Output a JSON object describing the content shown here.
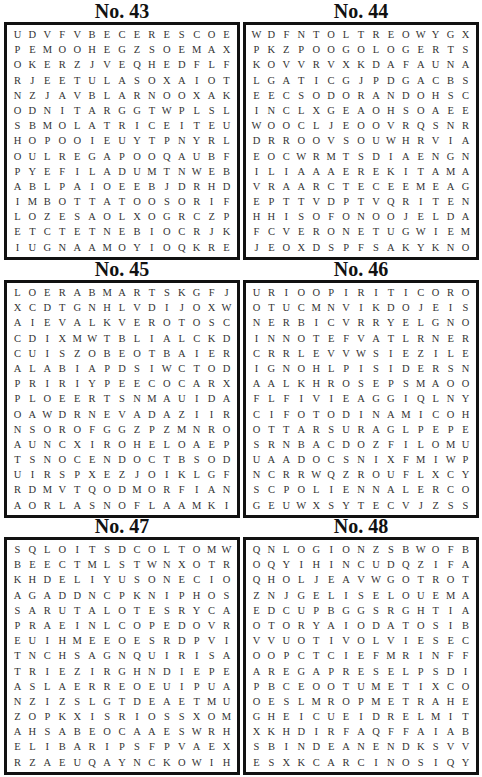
{
  "puzzles": [
    {
      "title": "No. 43",
      "rows": [
        "UDVFVBECERESCOE",
        "PEMOOHEGZSOEMAX",
        "OKERZJVEQHEDFLF",
        "RJEETULASOXAIOT",
        "NZJAVBLARNOOXAK",
        "ODNITARGGTWPLSL",
        "SBMOLATRICEITEU",
        "HOPOOIEUYTPNYRL",
        "OULREGAPOOQAUBF",
        "PYEFILADUMTNWEB",
        "ABLPAIOEEBJDRHD",
        "IMBOTTATOOSORIF",
        "LOZESAOLXOGRCZP",
        "ETCTETNEBIOCRJK",
        "IUGNAAMOYIOQKRE"
      ]
    },
    {
      "title": "No. 44",
      "rows": [
        "WDFNTOLTREOWYGX",
        "PKZPOOGOLOGERTS",
        "KOVVRVXKDAFAUNA",
        "LGATICGJPDGACBS",
        "EECSODORANDOHSC",
        "INCLXGEAOHSOAEE",
        "WOOCLJEOOVRQSNR",
        "DRROOVSOUWHRVIA",
        "EOCWRMTSDIAENGN",
        "ILIAAAEREKITAMA",
        "VRAARCTECEEMEAG",
        "EPTTVDPTVQRITEN",
        "HHISOFONOOJELDA",
        "FCVERONETUGWIEM",
        "JEOXDSPFSAKYKNO"
      ]
    },
    {
      "title": "No. 45",
      "rows": [
        "LOERABMARTSKGFJ",
        "XCDTGNHLVDIJOXW",
        "AIEVALKVEROTOSC",
        "CDIXMWTBLIALCKD",
        "CUISZOBEOTBAIER",
        "ALABIAPDSIWCTOD",
        "PRIRIYPEECOCARX",
        "PLOEERTSNMAUIDA",
        "OAWDRNEVADAZIIR",
        "NSOROFGGZPZMNRO",
        "AUNCXIROHELOAEP",
        "TSNOCENDOCTBSOD",
        "UIRSPXEZJOIKLGF",
        "RDMVTQODMORFIAN",
        "AORLASNOFLAAMKI"
      ]
    },
    {
      "title": "No. 46",
      "rows": [
        "URIOOPIRITICORO",
        "OTUCMNVIKDOJEIS",
        "NERBICVRRYELGNO",
        "INNOTEFVATLRNER",
        "CRRLEVVWSIEZILE",
        "IGNOHLPISIDERSN",
        "AALKHROSEPSMAOO",
        "FLFIVIEAGGIQLNY",
        "CIFOTODINAMICOH",
        "OTTARSURAGLPEPE",
        "SRNBACDOZFILOMU",
        "UAADOCSNIXFMIWP",
        "NCRRWQZROUFLXCY",
        "SCPOLIENNALERCO",
        "GEUWXSYTECVJZSS"
      ]
    },
    {
      "title": "No. 47",
      "rows": [
        "SQLOITSDCOLTOMW",
        "BEECTMLSTWNXOTR",
        "KHDELIYUSONECIO",
        "AGADDNCPKNIPHOS",
        "SARUTALOTESRYCA",
        "PRAEINLCOPEDOVR",
        "EUIHMEEOESRDPVI",
        "TNCHSAGNQUIRISA",
        "TRIEZIRGHNDIEPE",
        "ASLAERREOEUIPUA",
        "NZIZSLGTDEAETMU",
        "ZOPKXISRIOSSXOM",
        "AHSABEOCAAESWRH",
        "ELIBARIPSFPVAEX",
        "RZAEUQAYNCKOWIH"
      ]
    },
    {
      "title": "No. 48",
      "rows": [
        "QNLOGIONZSBWOFB",
        "OQYIHINCUDQZIFA",
        "QHOLJEAVWGOTROT",
        "ZNJGELISELOUEMA",
        "EDCUPBGGSRGHTIA",
        "OTORYAIODATOSIB",
        "VVUOTIVOLVIESEC",
        "OOPCTCIEFMRINFF",
        "AREGAPRESELPSDI",
        "PBCEOOTUMETIXCO",
        "OESLMROPMETRAHE",
        "GHEICUEIDRELMIT",
        "XKHDIRFAQFFAIAB",
        "SBINDEANENDKSVV",
        "ESXKCARCINOSIQY"
      ]
    }
  ]
}
